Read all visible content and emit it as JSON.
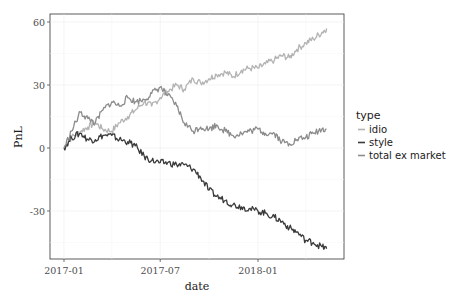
{
  "chart_data": {
    "type": "line",
    "title": "",
    "xlabel": "date",
    "ylabel": "PnL",
    "x_ticks": [
      "2017-01",
      "2017-07",
      "2018-01"
    ],
    "y_ticks": [
      60,
      30,
      0,
      -30
    ],
    "ylim": [
      -53,
      64
    ],
    "grid": true,
    "legend_position": "right",
    "legend_title": "type",
    "x": [
      "2017-01-01",
      "2017-01-15",
      "2017-02-01",
      "2017-02-15",
      "2017-03-01",
      "2017-03-15",
      "2017-04-01",
      "2017-04-15",
      "2017-05-01",
      "2017-05-15",
      "2017-06-01",
      "2017-06-15",
      "2017-07-01",
      "2017-07-15",
      "2017-08-01",
      "2017-08-15",
      "2017-09-01",
      "2017-09-15",
      "2017-10-01",
      "2017-10-15",
      "2017-11-01",
      "2017-11-15",
      "2017-12-01",
      "2017-12-15",
      "2018-01-01",
      "2018-01-15",
      "2018-02-01",
      "2018-02-15",
      "2018-03-01",
      "2018-03-15",
      "2018-04-01",
      "2018-04-15",
      "2018-05-01",
      "2018-05-10"
    ],
    "series": [
      {
        "name": "idio",
        "color": "#b3b3b3",
        "values": [
          0,
          5,
          8,
          10,
          12,
          9,
          8,
          12,
          15,
          18,
          22,
          20,
          24,
          27,
          30,
          28,
          33,
          31,
          33,
          35,
          36,
          34,
          37,
          38,
          38,
          40,
          42,
          44,
          43,
          47,
          50,
          52,
          55,
          57
        ]
      },
      {
        "name": "style",
        "color": "#3a3a3a",
        "values": [
          0,
          5,
          7,
          4,
          4,
          6,
          6,
          4,
          3,
          1,
          -4,
          -6,
          -7,
          -7,
          -8,
          -8,
          -10,
          -14,
          -20,
          -23,
          -25,
          -27,
          -28,
          -29,
          -30,
          -31,
          -33,
          -35,
          -38,
          -40,
          -44,
          -45,
          -47,
          -48
        ]
      },
      {
        "name": "total ex market",
        "color": "#8c8c8c",
        "values": [
          0,
          8,
          17,
          14,
          12,
          18,
          22,
          20,
          24,
          22,
          23,
          26,
          29,
          25,
          20,
          12,
          8,
          10,
          9,
          11,
          8,
          6,
          7,
          8,
          9,
          7,
          7,
          3,
          2,
          4,
          5,
          7,
          9,
          9
        ]
      }
    ]
  }
}
